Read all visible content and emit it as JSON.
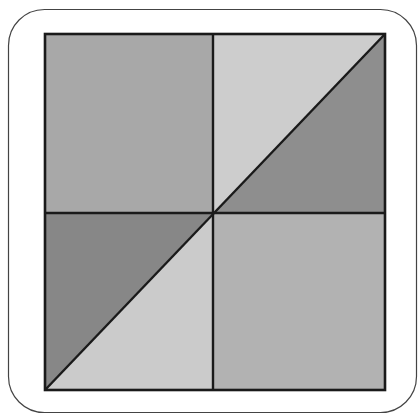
{
  "figure": {
    "frame": {
      "x": 8.5,
      "y": 9.5,
      "width": 408,
      "height": 403,
      "radius": 36,
      "stroke": "#444444"
    },
    "square": {
      "x1": 45,
      "y1": 34,
      "x2": 385,
      "y2": 390,
      "stroke": "#1a1a1a"
    },
    "center": {
      "x": 213,
      "y": 213
    },
    "colors": {
      "top_left_square": "#a8a8a8",
      "top_right_upper_triangle": "#cdcdcd",
      "top_right_lower_triangle": "#8e8e8e",
      "bottom_left_upper_triangle": "#878787",
      "bottom_left_lower_triangle": "#cbcbcb",
      "bottom_right_square": "#b2b2b2"
    }
  }
}
